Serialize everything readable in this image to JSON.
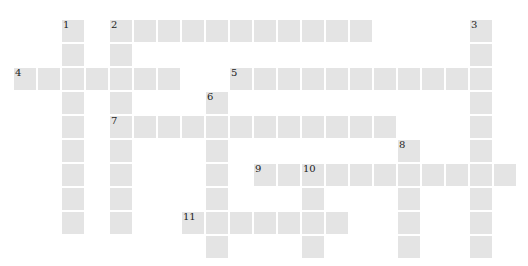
{
  "puzzle": {
    "type": "crossword",
    "grid": {
      "origin_x": 14,
      "origin_y": 20,
      "pitch": 24,
      "cell_size": 22,
      "cell_color": "#e4e4e4"
    },
    "entries": [
      {
        "number": "1",
        "direction": "down",
        "row": 0,
        "col": 2,
        "length": 9
      },
      {
        "number": "2",
        "direction": "across",
        "row": 0,
        "col": 4,
        "length": 11
      },
      {
        "number": "2",
        "direction": "down",
        "row": 0,
        "col": 4,
        "length": 9
      },
      {
        "number": "3",
        "direction": "down",
        "row": 0,
        "col": 19,
        "length": 10
      },
      {
        "number": "4",
        "direction": "across",
        "row": 2,
        "col": 0,
        "length": 7
      },
      {
        "number": "5",
        "direction": "across",
        "row": 2,
        "col": 9,
        "length": 11
      },
      {
        "number": "6",
        "direction": "down",
        "row": 3,
        "col": 8,
        "length": 7
      },
      {
        "number": "7",
        "direction": "across",
        "row": 4,
        "col": 4,
        "length": 12
      },
      {
        "number": "8",
        "direction": "down",
        "row": 5,
        "col": 16,
        "length": 5
      },
      {
        "number": "9",
        "direction": "across",
        "row": 6,
        "col": 10,
        "length": 11
      },
      {
        "number": "10",
        "direction": "down",
        "row": 6,
        "col": 12,
        "length": 4
      },
      {
        "number": "11",
        "direction": "across",
        "row": 8,
        "col": 7,
        "length": 7
      }
    ]
  }
}
